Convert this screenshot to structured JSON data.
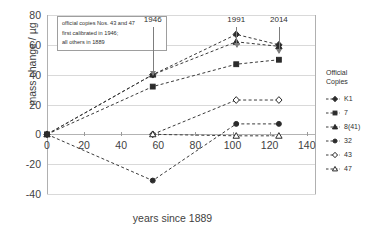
{
  "chart_data": {
    "type": "line",
    "title": "",
    "xlabel": "years since 1889",
    "ylabel": "mass change / µg",
    "xlim": [
      0,
      145
    ],
    "ylim": [
      -40,
      80
    ],
    "xticks": [
      0,
      20,
      40,
      60,
      80,
      100,
      120,
      140
    ],
    "yticks": [
      -40,
      -20,
      0,
      20,
      40,
      60,
      80
    ],
    "grid": true,
    "legend_position": "right",
    "legend_title": "Official Copies",
    "annotations": [
      {
        "name": "calibration-note",
        "lines": [
          "official copies Nos. 43 and 47",
          "first calibrated in 1946;",
          "all others in 1889"
        ]
      },
      {
        "name": "year-1946",
        "label": "1946",
        "x": 57
      },
      {
        "name": "year-1991",
        "label": "1991",
        "x": 102
      },
      {
        "name": "year-2014",
        "label": "2014",
        "x": 125
      }
    ],
    "series": [
      {
        "name": "K1",
        "marker": "diamond-filled",
        "x": [
          0,
          57,
          102,
          125
        ],
        "values": [
          0,
          40,
          67,
          60
        ]
      },
      {
        "name": "7",
        "marker": "square-filled",
        "x": [
          0,
          57,
          102,
          125
        ],
        "values": [
          0,
          32,
          47,
          50
        ]
      },
      {
        "name": "8(41)",
        "marker": "triangle-filled",
        "x": [
          0,
          57,
          102,
          125
        ],
        "values": [
          0,
          40,
          62,
          59
        ]
      },
      {
        "name": "32",
        "marker": "circle-filled",
        "x": [
          0,
          57,
          102,
          125
        ],
        "values": [
          0,
          -31,
          7,
          7
        ]
      },
      {
        "name": "43",
        "marker": "diamond-open",
        "x": [
          57,
          102,
          125
        ],
        "values": [
          0,
          23,
          23
        ]
      },
      {
        "name": "47",
        "marker": "triangle-open",
        "x": [
          57,
          102,
          125
        ],
        "values": [
          0,
          -1,
          -1
        ]
      }
    ]
  }
}
